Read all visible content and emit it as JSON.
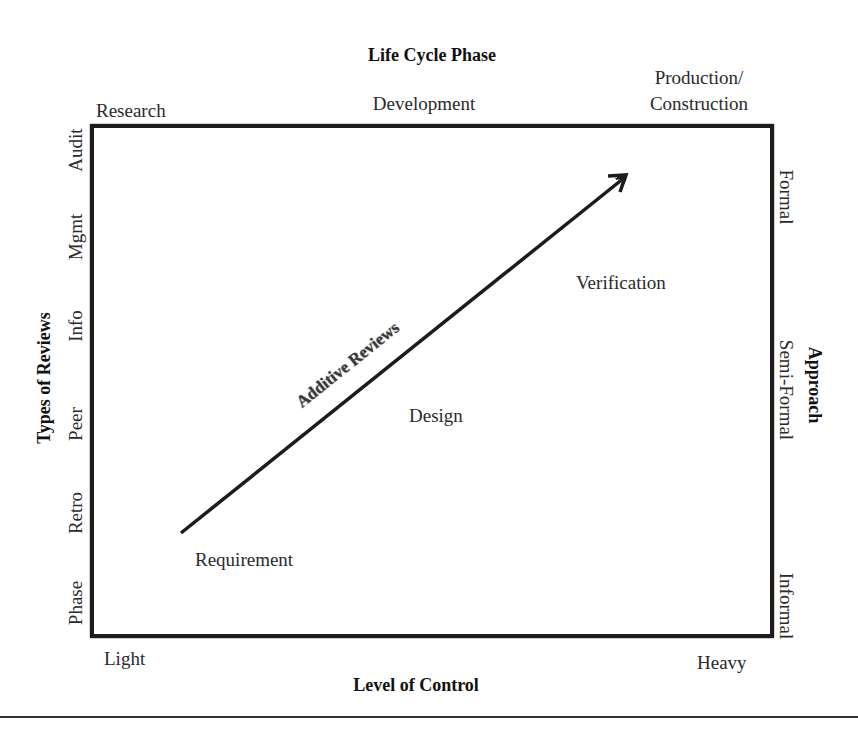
{
  "top_axis": {
    "title": "Life Cycle Phase",
    "labels": [
      "Research",
      "Development",
      "Production/",
      "Construction"
    ]
  },
  "bottom_axis": {
    "title": "Level of Control",
    "labels": [
      "Light",
      "Heavy"
    ]
  },
  "left_axis": {
    "title": "Types of Reviews",
    "labels": [
      "Audit",
      "Mgmt",
      "Info",
      "Peer",
      "Retro",
      "Phase"
    ]
  },
  "right_axis": {
    "title": "Approach",
    "labels": [
      "Formal",
      "Semi-Formal",
      "Informal"
    ]
  },
  "inner": {
    "arrow_label": "Additive Reviews",
    "phases": [
      "Requirement",
      "Design",
      "Verification"
    ]
  },
  "colors": {
    "line": "#1c1c1c",
    "text": "#2a2a2a"
  }
}
